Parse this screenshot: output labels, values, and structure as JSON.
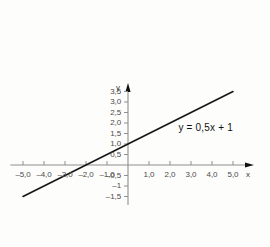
{
  "chart_data": {
    "type": "line",
    "title": "",
    "subtitle": "",
    "xlabel": "x",
    "ylabel": "y",
    "xlim": [
      -5.6,
      6.0
    ],
    "ylim": [
      -1.9,
      3.9
    ],
    "grid": false,
    "legend": "none",
    "annotations": [
      {
        "name": "function-equation",
        "text": "y = 0,5x + 1",
        "x": 2.4,
        "y": 1.75
      }
    ],
    "series": [
      {
        "name": "y = 0,5x + 1",
        "type": "line",
        "slope": 0.5,
        "intercept": 1,
        "color": "#151515",
        "x": [
          -5,
          5
        ],
        "values": [
          -1.5,
          3.5
        ],
        "points": [
          {
            "x": -5,
            "y": -1.5
          },
          {
            "x": -2,
            "y": 0
          },
          {
            "x": 0,
            "y": 1
          },
          {
            "x": 5,
            "y": 3.5
          }
        ]
      }
    ],
    "x_ticks": [
      {
        "value": -5,
        "label": "–5,0"
      },
      {
        "value": -4,
        "label": "–4,0"
      },
      {
        "value": -3,
        "label": "–3,0"
      },
      {
        "value": -2,
        "label": "–2,0"
      },
      {
        "value": -1,
        "label": "–1,0"
      },
      {
        "value": 1,
        "label": "1,0"
      },
      {
        "value": 2,
        "label": "2,0"
      },
      {
        "value": 3,
        "label": "3,0"
      },
      {
        "value": 4,
        "label": "4,0"
      },
      {
        "value": 5,
        "label": "5,0"
      }
    ],
    "y_ticks": [
      {
        "value": 3.5,
        "label": "3,5"
      },
      {
        "value": 3.0,
        "label": "3,0"
      },
      {
        "value": 2.5,
        "label": "2,5"
      },
      {
        "value": 2.0,
        "label": "2,0"
      },
      {
        "value": 1.5,
        "label": "1,5"
      },
      {
        "value": 1.0,
        "label": "1,0"
      },
      {
        "value": 0.5,
        "label": "0,5"
      },
      {
        "value": -0.5,
        "label": "–0,5"
      },
      {
        "value": -1.0,
        "label": "–1"
      },
      {
        "value": -1.5,
        "label": "–1,5"
      }
    ],
    "colors": {
      "background": "#fdfdfb",
      "axis": "#8f8f8f",
      "arrow": "#111111",
      "tick": "#8f8f8f",
      "tick_label": "#4a4a4a",
      "curve": "#151515",
      "axis_name": "#3a3a3a"
    },
    "geometry": {
      "origin_x_px": 128,
      "origin_y_px": 165,
      "unit_px": 21
    }
  }
}
